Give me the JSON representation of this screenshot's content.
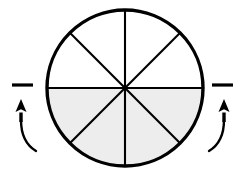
{
  "canvas": {
    "width": 241,
    "height": 179,
    "background_color": "#ffffff"
  },
  "figure": {
    "title": "Circle divided into eighths with bottom half shaded",
    "type": "geometric-diagram",
    "stroke_color": "#000000",
    "shaded_fill_color": "#ededed",
    "unshaded_fill_color": "#ffffff"
  },
  "circle": {
    "center_x": 125,
    "center_y": 88,
    "radius": 78,
    "outline_width": 3.4,
    "total_sectors": 8,
    "sector_angle_degrees": 45,
    "shaded_sectors": 4,
    "unshaded_sectors": 4,
    "fraction_shaded": "4/8",
    "shaded_region": "bottom half",
    "divider_count": 4,
    "divider_width": 2.1,
    "divider_angles_degrees": [
      0,
      45,
      90,
      135
    ]
  },
  "annotations": {
    "left": {
      "name": "rotation-marker-left",
      "dash": {
        "x1": 12,
        "y1": 85,
        "x2": 33,
        "y2": 85,
        "width": 3.2
      },
      "arrow": {
        "direction": "up",
        "shaft_x": 21,
        "tip_y": 99,
        "base_y": 122,
        "head_width": 11,
        "head_height": 13,
        "shaft_width": 3.4
      },
      "tail": {
        "path": "M 21 120 C 21 136, 26 145, 36 151",
        "width": 2.4
      }
    },
    "right": {
      "name": "rotation-marker-right",
      "dash": {
        "x1": 212,
        "y1": 85,
        "x2": 233,
        "y2": 85,
        "width": 3.2
      },
      "arrow": {
        "direction": "up",
        "shaft_x": 224,
        "tip_y": 99,
        "base_y": 122,
        "head_width": 11,
        "head_height": 13,
        "shaft_width": 3.4
      },
      "tail": {
        "path": "M 224 120 C 224 136, 219 145, 209 151",
        "width": 2.4
      }
    }
  }
}
